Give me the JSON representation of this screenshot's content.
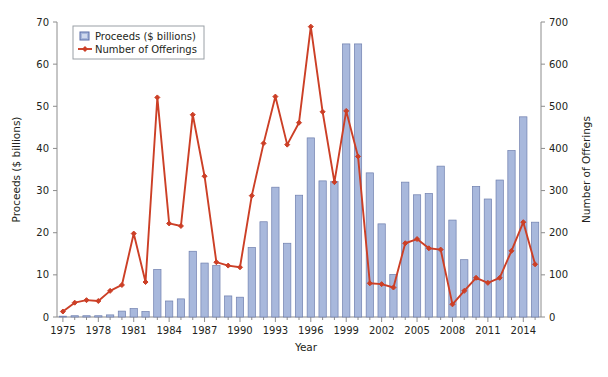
{
  "chart_data": {
    "type": "bar",
    "title": "",
    "xlabel": "Year",
    "ylabel": "Proceeds ($ billions)",
    "y2label": "Number of Offerings",
    "ylim": [
      0,
      70
    ],
    "y2lim": [
      0,
      700
    ],
    "xlim": [
      1975,
      2015
    ],
    "grid": false,
    "legend_position": "top-left",
    "y_ticks": [
      0,
      10,
      20,
      30,
      40,
      50,
      60,
      70
    ],
    "y2_ticks": [
      0,
      100,
      200,
      300,
      400,
      500,
      600,
      700
    ],
    "x_ticks": [
      1975,
      1978,
      1981,
      1984,
      1987,
      1990,
      1993,
      1996,
      1999,
      2002,
      2005,
      2008,
      2011,
      2014
    ],
    "categories": [
      1975,
      1976,
      1977,
      1978,
      1979,
      1980,
      1981,
      1982,
      1983,
      1984,
      1985,
      1986,
      1987,
      1988,
      1989,
      1990,
      1991,
      1992,
      1993,
      1994,
      1995,
      1996,
      1997,
      1998,
      1999,
      2000,
      2001,
      2002,
      2003,
      2004,
      2005,
      2006,
      2007,
      2008,
      2009,
      2010,
      2011,
      2012,
      2013,
      2014,
      2015
    ],
    "series": [
      {
        "name": "Proceeds ($ billions)",
        "axis": "left",
        "kind": "bar",
        "color": "#a8b8dc",
        "edge_color": "#6f7fae",
        "values": [
          0.2,
          0.3,
          0.3,
          0.3,
          0.5,
          1.4,
          2.0,
          1.3,
          11.3,
          3.8,
          4.3,
          15.6,
          12.8,
          12.2,
          5.0,
          4.7,
          16.5,
          22.6,
          30.8,
          17.5,
          28.9,
          42.5,
          32.3,
          32.2,
          64.8,
          64.8,
          34.2,
          22.1,
          10.1,
          32.0,
          29.0,
          29.3,
          35.8,
          23.0,
          13.6,
          31.0,
          28.0,
          32.5,
          39.5,
          47.5,
          22.5
        ]
      },
      {
        "name": "Number of Offerings",
        "axis": "right",
        "kind": "line",
        "color": "#cc3f26",
        "marker": "filled-diamond",
        "values": [
          13,
          34,
          40,
          38,
          62,
          76,
          198,
          83,
          521,
          222,
          216,
          480,
          334,
          130,
          122,
          118,
          288,
          412,
          523,
          409,
          461,
          689,
          487,
          320,
          489,
          381,
          80,
          78,
          70,
          175,
          185,
          163,
          160,
          30,
          62,
          93,
          81,
          93,
          157,
          225,
          125
        ]
      }
    ],
    "legend": [
      {
        "label": "Proceeds ($ billions)",
        "marker": "square",
        "color": "#a8b8dc"
      },
      {
        "label": "Number of Offerings",
        "marker": "line-diamond",
        "color": "#cc3f26"
      }
    ]
  }
}
